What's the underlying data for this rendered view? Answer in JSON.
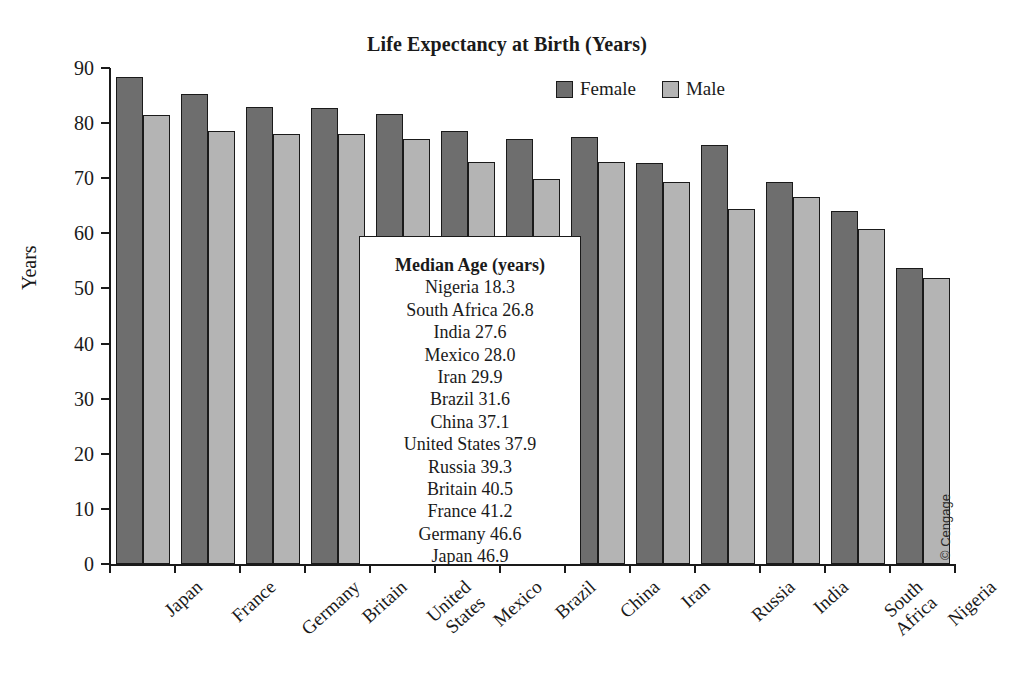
{
  "chart_data": {
    "type": "bar",
    "title": "Life Expectancy at Birth (Years)",
    "xlabel": "",
    "ylabel": "Years",
    "ylim": [
      0,
      90
    ],
    "yticks": [
      0,
      10,
      20,
      30,
      40,
      50,
      60,
      70,
      80,
      90
    ],
    "grid": false,
    "legend_position": "top-right",
    "categories": [
      "Japan",
      "France",
      "Germany",
      "Britain",
      "United States",
      "Mexico",
      "Brazil",
      "China",
      "Iran",
      "Russia",
      "India",
      "South Africa",
      "Nigeria"
    ],
    "series": [
      {
        "name": "Female",
        "color": "#6e6e6e",
        "values": [
          88.3,
          85.3,
          83.0,
          82.7,
          81.6,
          78.6,
          77.1,
          77.5,
          72.8,
          76.1,
          69.3,
          64.0,
          53.8
        ]
      },
      {
        "name": "Male",
        "color": "#b4b4b4",
        "values": [
          81.5,
          78.5,
          78.1,
          78.0,
          77.1,
          73.0,
          69.8,
          73.0,
          69.4,
          64.4,
          66.6,
          60.8,
          51.9
        ]
      }
    ],
    "annotations": {
      "inset": {
        "title": "Median Age (years)",
        "rows": [
          "Nigeria 18.3",
          "South Africa 26.8",
          "India 27.6",
          "Mexico 28.0",
          "Iran 29.9",
          "Brazil 31.6",
          "China 37.1",
          "United States 37.9",
          "Russia 39.3",
          "Britain 40.5",
          "France 41.2",
          "Germany 46.6",
          "Japan 46.9"
        ]
      },
      "credit": "© Cengage"
    },
    "category_label_lines": [
      [
        "Japan"
      ],
      [
        "France"
      ],
      [
        "Germany"
      ],
      [
        "Britain"
      ],
      [
        "United",
        "States"
      ],
      [
        "Mexico"
      ],
      [
        "Brazil"
      ],
      [
        "China"
      ],
      [
        "Iran"
      ],
      [
        "Russia"
      ],
      [
        "India"
      ],
      [
        "South",
        "Africa"
      ],
      [
        "Nigeria"
      ]
    ]
  }
}
